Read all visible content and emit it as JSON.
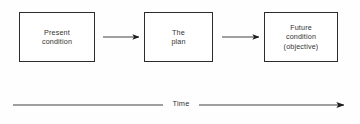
{
  "diagram": {
    "background_color": "#fefefe",
    "line_color": "#2c2c2c",
    "text_color": "#333333",
    "nodes": [
      {
        "id": "present-condition",
        "lines": [
          "Present",
          "condition"
        ],
        "line1": "Present",
        "line2": "condition"
      },
      {
        "id": "the-plan",
        "lines": [
          "The",
          "plan"
        ],
        "line1": "The",
        "line2": "plan"
      },
      {
        "id": "future-condition",
        "lines": [
          "Future",
          "condition",
          "(objective)"
        ],
        "line1": "Future",
        "line2": "condition",
        "line3": "(objective)"
      }
    ],
    "connectors": [
      {
        "id": "arrow-present-to-plan",
        "from": "present-condition",
        "to": "the-plan"
      },
      {
        "id": "arrow-plan-to-future",
        "from": "the-plan",
        "to": "future-condition"
      }
    ],
    "axis": {
      "id": "time-axis",
      "label": "Time",
      "direction": "left-to-right"
    }
  }
}
